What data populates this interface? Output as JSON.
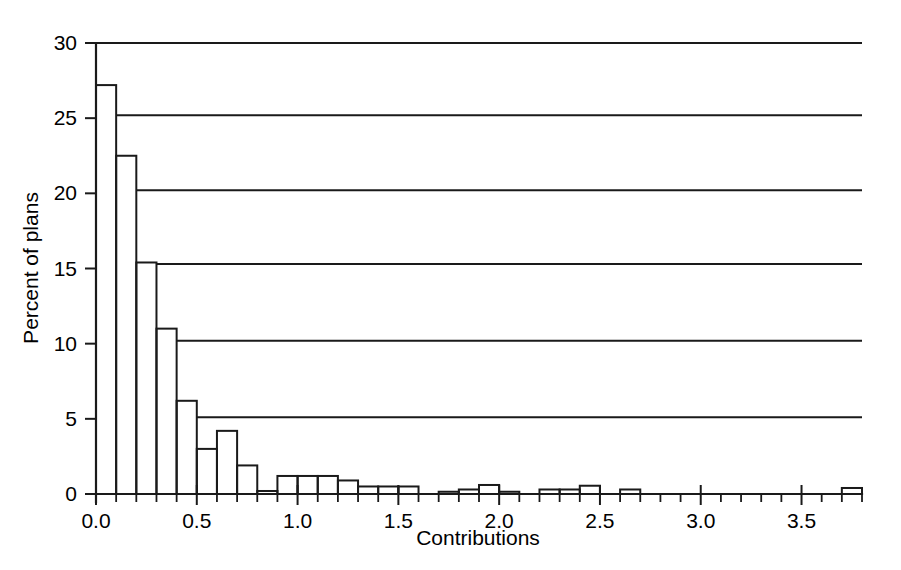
{
  "chart_data": {
    "type": "bar",
    "title": "",
    "subtitle": "",
    "xlabel": "Contributions",
    "ylabel": "Percent of plans",
    "xlim": [
      0.0,
      3.8
    ],
    "ylim": [
      0,
      30
    ],
    "bin_width": 0.1,
    "grid": "horizontal-partial",
    "legend": "none",
    "x_tick_labels": [
      "0.0",
      "0.5",
      "1.0",
      "1.5",
      "2.0",
      "2.5",
      "3.0",
      "3.5"
    ],
    "x_tick_values": [
      0.0,
      0.5,
      1.0,
      1.5,
      2.0,
      2.5,
      3.0,
      3.5
    ],
    "x_minor_tick_step": 0.1,
    "y_tick_labels": [
      "0",
      "5",
      "10",
      "15",
      "20",
      "25",
      "30"
    ],
    "y_tick_values": [
      0,
      5,
      10,
      15,
      20,
      25,
      30
    ],
    "bin_starts": [
      0.0,
      0.1,
      0.2,
      0.3,
      0.4,
      0.5,
      0.6,
      0.7,
      0.8,
      0.9,
      1.0,
      1.1,
      1.2,
      1.3,
      1.4,
      1.5,
      1.6,
      1.7,
      1.8,
      1.9,
      2.0,
      2.1,
      2.2,
      2.3,
      2.4,
      2.5,
      2.6,
      2.7,
      2.8,
      2.9,
      3.0,
      3.1,
      3.2,
      3.3,
      3.4,
      3.5,
      3.6,
      3.7
    ],
    "values": [
      27.2,
      22.5,
      15.4,
      11.0,
      6.2,
      3.0,
      4.2,
      1.9,
      0.2,
      1.2,
      1.2,
      1.2,
      0.9,
      0.5,
      0.5,
      0.5,
      0.0,
      0.15,
      0.3,
      0.6,
      0.15,
      0.0,
      0.3,
      0.3,
      0.55,
      0.0,
      0.3,
      0.0,
      0.0,
      0.0,
      0.0,
      0.0,
      0.0,
      0.0,
      0.0,
      0.0,
      0.0,
      0.4
    ],
    "gridline_levels": [
      30.0,
      25.2,
      20.2,
      15.3,
      10.2,
      5.1
    ],
    "colors": {
      "axis": "#1a1a1a",
      "bar_stroke": "#1a1a1a",
      "bar_fill": "#ffffff",
      "background": "#ffffff",
      "gridline": "#1a1a1a"
    }
  }
}
